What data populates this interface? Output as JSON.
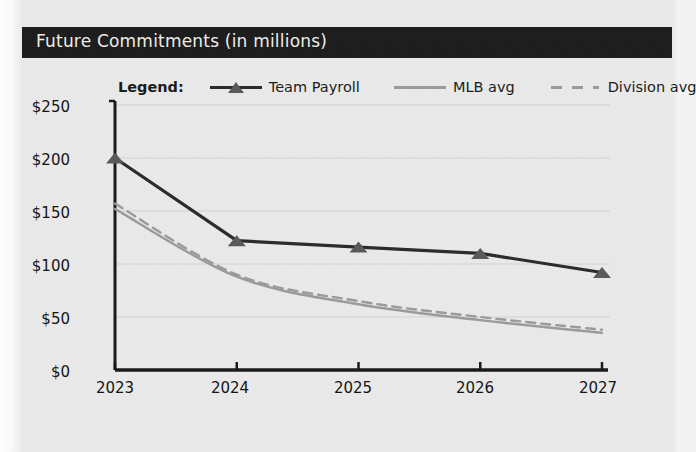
{
  "panel": {
    "title": "Future Commitments (in millions)",
    "title_bar_color": "#1d1d1d",
    "title_text_color": "#f0eee9",
    "background_color": "#eaeaea"
  },
  "legend": {
    "title": "Legend:",
    "position": "top-center",
    "entries": [
      {
        "label": "Team Payroll",
        "style": "solid-with-triangle-marker",
        "color": "#2b2b2b"
      },
      {
        "label": "MLB avg",
        "style": "solid",
        "color": "#9b9b9b"
      },
      {
        "label": "Division avg",
        "style": "dashed",
        "color": "#9b9b9b"
      }
    ]
  },
  "chart_data": {
    "type": "line",
    "title": "Future Commitments (in millions)",
    "xlabel": "",
    "ylabel": "",
    "categories": [
      "2023",
      "2024",
      "2025",
      "2026",
      "2027"
    ],
    "x": [
      2023,
      2024,
      2025,
      2026,
      2027
    ],
    "ylim": [
      0,
      250
    ],
    "ytick_labels": [
      "$0",
      "$50",
      "$100",
      "$150",
      "$200",
      "$250"
    ],
    "ytick_values": [
      0,
      50,
      100,
      150,
      200,
      250
    ],
    "xtick_labels": [
      "2023",
      "2024",
      "2025",
      "2026",
      "2027"
    ],
    "grid": "horizontal",
    "legend_position": "top-center",
    "series": [
      {
        "name": "Team Payroll",
        "color": "#2b2b2b",
        "style": "solid",
        "marker": "triangle",
        "values": [
          200,
          122,
          116,
          110,
          92
        ]
      },
      {
        "name": "MLB avg",
        "color": "#9b9b9b",
        "style": "solid",
        "marker": "none",
        "values": [
          152,
          88,
          62,
          47,
          35
        ]
      },
      {
        "name": "Division avg",
        "color": "#9b9b9b",
        "style": "dashed",
        "marker": "none",
        "values": [
          157,
          90,
          65,
          50,
          38
        ]
      }
    ]
  },
  "axes": {
    "y_labels": [
      "$250",
      "$200",
      "$150",
      "$100",
      "$50",
      "$0"
    ],
    "x_labels": [
      "2023",
      "2024",
      "2025",
      "2026",
      "2027"
    ]
  }
}
